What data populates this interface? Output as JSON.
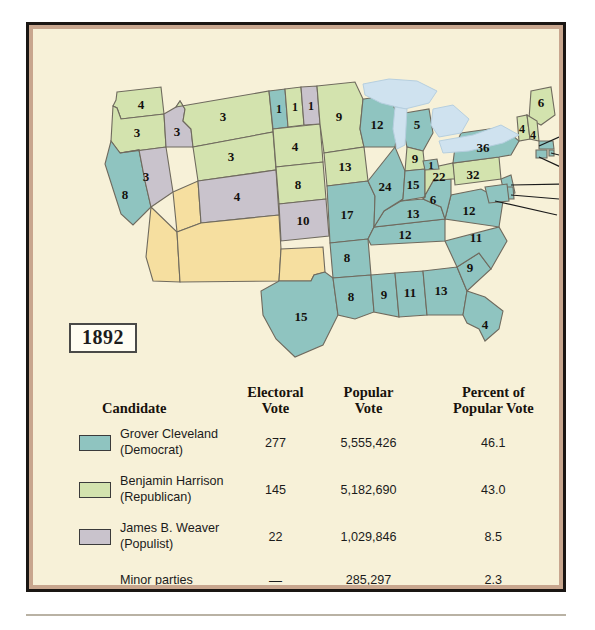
{
  "plate": {
    "year_label": "1892",
    "title_hidden": ""
  },
  "map": {
    "name": "1892 United States presidential election electoral map",
    "colors": {
      "democrat_teal": "#8fc4c0",
      "republican_green": "#d3e3ae",
      "populist_gray": "#c9c3cc",
      "territory_yellow": "#f6dfa0",
      "lake_blue": "#cfe2ef",
      "background_cream": "#f7f1d8",
      "border_line": "#6f6a5e"
    },
    "states": [
      {
        "code": "WA",
        "votes": "4",
        "party": "republican"
      },
      {
        "code": "OR",
        "votes": "3",
        "party": "republican"
      },
      {
        "code": "CA",
        "votes": "8",
        "party": "democrat"
      },
      {
        "code": "NV",
        "votes": "3",
        "party": "populist"
      },
      {
        "code": "ID",
        "votes": "3",
        "party": "populist"
      },
      {
        "code": "MT",
        "votes": "3",
        "party": "republican"
      },
      {
        "code": "WY",
        "votes": "3",
        "party": "republican"
      },
      {
        "code": "UT",
        "votes": "",
        "party": "territory"
      },
      {
        "code": "CO",
        "votes": "4",
        "party": "populist"
      },
      {
        "code": "NE",
        "votes": "8",
        "party": "republican"
      },
      {
        "code": "SD",
        "votes": "4",
        "party": "republican"
      },
      {
        "code": "ND-a",
        "votes": "1",
        "party": "democrat"
      },
      {
        "code": "ND-b",
        "votes": "1",
        "party": "republican"
      },
      {
        "code": "ND-c",
        "votes": "1",
        "party": "populist"
      },
      {
        "code": "MN",
        "votes": "9",
        "party": "republican"
      },
      {
        "code": "IA",
        "votes": "13",
        "party": "republican"
      },
      {
        "code": "KS",
        "votes": "10",
        "party": "populist"
      },
      {
        "code": "MO",
        "votes": "17",
        "party": "democrat"
      },
      {
        "code": "AR",
        "votes": "8",
        "party": "democrat"
      },
      {
        "code": "TX",
        "votes": "15",
        "party": "democrat"
      },
      {
        "code": "LA",
        "votes": "8",
        "party": "democrat"
      },
      {
        "code": "MS",
        "votes": "9",
        "party": "democrat"
      },
      {
        "code": "AL",
        "votes": "11",
        "party": "democrat"
      },
      {
        "code": "GA",
        "votes": "13",
        "party": "democrat"
      },
      {
        "code": "FL",
        "votes": "4",
        "party": "democrat"
      },
      {
        "code": "SC",
        "votes": "9",
        "party": "democrat"
      },
      {
        "code": "NC",
        "votes": "11",
        "party": "democrat"
      },
      {
        "code": "TN",
        "votes": "12",
        "party": "democrat"
      },
      {
        "code": "KY",
        "votes": "13",
        "party": "democrat"
      },
      {
        "code": "VA",
        "votes": "12",
        "party": "democrat"
      },
      {
        "code": "WV",
        "votes": "6",
        "party": "democrat"
      },
      {
        "code": "WI",
        "votes": "12",
        "party": "democrat"
      },
      {
        "code": "MI-a",
        "votes": "5",
        "party": "democrat"
      },
      {
        "code": "MI-b",
        "votes": "9",
        "party": "republican"
      },
      {
        "code": "IL",
        "votes": "24",
        "party": "democrat"
      },
      {
        "code": "IN",
        "votes": "15",
        "party": "democrat"
      },
      {
        "code": "OH-a",
        "votes": "22",
        "party": "republican"
      },
      {
        "code": "OH-b",
        "votes": "1",
        "party": "democrat"
      },
      {
        "code": "PA",
        "votes": "32",
        "party": "republican"
      },
      {
        "code": "NY",
        "votes": "36",
        "party": "democrat"
      },
      {
        "code": "ME",
        "votes": "6",
        "party": "republican"
      },
      {
        "code": "VT",
        "votes": "4",
        "party": "republican"
      },
      {
        "code": "NH",
        "votes": "4",
        "party": "republican"
      }
    ],
    "leader_labels": [
      {
        "code": "MA",
        "votes": "15"
      },
      {
        "code": "RI",
        "votes": "4"
      },
      {
        "code": "CT",
        "votes": "6"
      },
      {
        "code": "NJ",
        "votes": "10"
      },
      {
        "code": "DE",
        "votes": "3"
      },
      {
        "code": "MD",
        "votes": "8"
      }
    ]
  },
  "table": {
    "headers": {
      "candidate": "Candidate",
      "electoral_vote_l1": "Electoral",
      "electoral_vote_l2": "Vote",
      "popular_vote_l1": "Popular",
      "popular_vote_l2": "Vote",
      "percent_l1": "Percent of",
      "percent_l2": "Popular Vote"
    },
    "rows": [
      {
        "swatch": "#8fc4c0",
        "name": "Grover Cleveland",
        "party": "(Democrat)",
        "electoral": "277",
        "popular": "5,555,426",
        "percent": "46.1"
      },
      {
        "swatch": "#d3e3ae",
        "name": "Benjamin Harrison",
        "party": "(Republican)",
        "electoral": "145",
        "popular": "5,182,690",
        "percent": "43.0"
      },
      {
        "swatch": "#c9c3cc",
        "name": "James B. Weaver",
        "party": "(Populist)",
        "electoral": "22",
        "popular": "1,029,846",
        "percent": "8.5"
      }
    ],
    "minor": {
      "name": "Minor parties",
      "party": "",
      "electoral": "—",
      "popular": "285,297",
      "percent": "2.3"
    }
  }
}
